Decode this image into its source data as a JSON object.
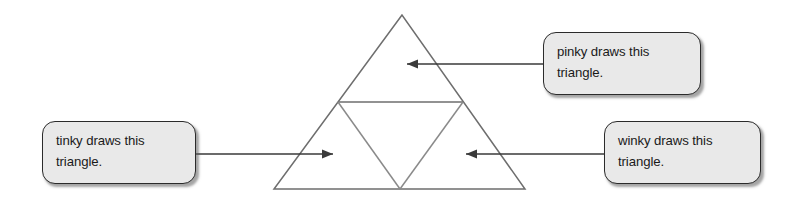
{
  "figure": {
    "type": "geometry-diagram",
    "stroke_color": "#6e6e6e",
    "arrow_color": "#3a3a3a",
    "background_color": "#ffffff",
    "outer_triangle": {
      "apex": [
        402,
        15
      ],
      "left_base": [
        274,
        189
      ],
      "right_base": [
        525,
        189
      ]
    },
    "midline": {
      "left_midpoint": [
        338,
        102
      ],
      "right_midpoint": [
        463,
        102
      ]
    },
    "inverted_triangle": {
      "left": [
        338,
        102
      ],
      "right": [
        463,
        102
      ],
      "bottom": [
        400,
        189
      ]
    }
  },
  "callouts": [
    {
      "id": "pinky",
      "fill": "#e9e9e9",
      "border": "#2b2b2b",
      "lines": [
        "pinky draws this",
        "triangle."
      ],
      "arrow": {
        "direction": "left",
        "from": [
          543,
          64
        ],
        "to": [
          404,
          64
        ]
      },
      "target": "top-triangle"
    },
    {
      "id": "tinky",
      "fill": "#e9e9e9",
      "border": "#2b2b2b",
      "lines": [
        "tinky draws this",
        "triangle."
      ],
      "arrow": {
        "direction": "right",
        "from": [
          196,
          154
        ],
        "to": [
          337,
          154
        ]
      },
      "target": "bottom-left-triangle"
    },
    {
      "id": "winky",
      "fill": "#e9e9e9",
      "border": "#2b2b2b",
      "lines": [
        "winky draws this",
        "triangle."
      ],
      "arrow": {
        "direction": "left",
        "from": [
          604,
          154
        ],
        "to": [
          463,
          154
        ]
      },
      "target": "bottom-right-triangle"
    }
  ]
}
